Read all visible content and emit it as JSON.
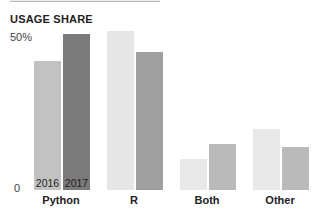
{
  "header": {
    "title": "USAGE SHARE"
  },
  "chart_data": {
    "type": "bar",
    "title": "USAGE SHARE",
    "xlabel": "",
    "ylabel": "",
    "categories": [
      "Python",
      "R",
      "Both",
      "Other"
    ],
    "series": [
      {
        "name": "2016",
        "values": [
          42,
          52,
          10,
          20
        ],
        "colors": [
          "#c2c2c2",
          "#e6e6e6",
          "#e8e8e8",
          "#e8e8e8"
        ]
      },
      {
        "name": "2017",
        "values": [
          51,
          45,
          15,
          14
        ],
        "colors": [
          "#7a7a7a",
          "#a0a0a0",
          "#bababa",
          "#bababa"
        ]
      }
    ],
    "yticks": [
      "0",
      "50%"
    ],
    "ylim": [
      0,
      50
    ],
    "grid": false,
    "legend": "inline labels on Python bars (2016, 2017)"
  }
}
